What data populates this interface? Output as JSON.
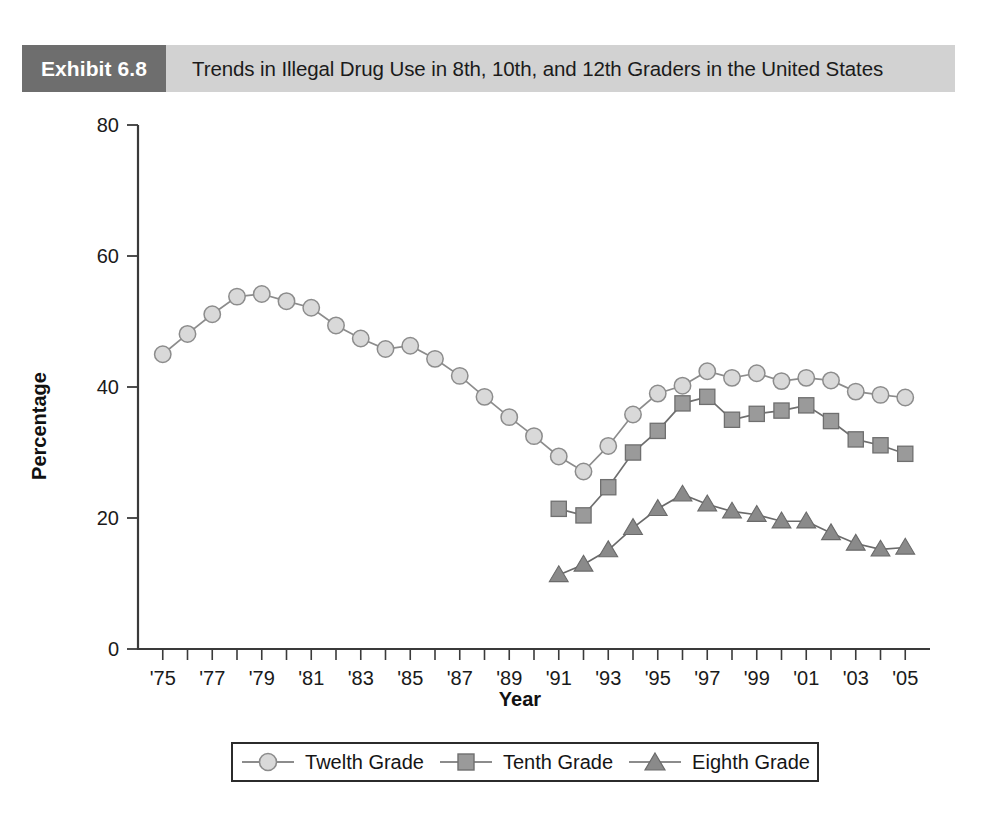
{
  "exhibit": {
    "tag": "Exhibit 6.8",
    "title": "Trends in Illegal Drug Use in 8th, 10th, and 12th Graders in the United States",
    "tag_bg": "#6e6e6e",
    "bar_bg": "#d2d2d2"
  },
  "chart_data": {
    "type": "line",
    "title": "Trends in Illegal Drug Use in 8th, 10th, and 12th Graders in the United States",
    "xlabel": "Year",
    "ylabel": "Percentage",
    "ylim": [
      0,
      80
    ],
    "yticks": [
      0,
      20,
      40,
      60,
      80
    ],
    "ytick_labels": [
      "0",
      "20",
      "40",
      "60",
      "80"
    ],
    "grid": false,
    "legend_position": "bottom",
    "x": [
      1975,
      1976,
      1977,
      1978,
      1979,
      1980,
      1981,
      1982,
      1983,
      1984,
      1985,
      1986,
      1987,
      1988,
      1989,
      1990,
      1991,
      1992,
      1993,
      1994,
      1995,
      1996,
      1997,
      1998,
      1999,
      2000,
      2001,
      2002,
      2003,
      2004,
      2005
    ],
    "xtick_labels": [
      "'75",
      "'77",
      "'79",
      "'81",
      "'83",
      "'85",
      "'87",
      "'89",
      "'91",
      "'93",
      "'95",
      "'97",
      "'99",
      "'01",
      "'03",
      "'05"
    ],
    "xtick_values": [
      1975,
      1977,
      1979,
      1981,
      1983,
      1985,
      1987,
      1989,
      1991,
      1993,
      1995,
      1997,
      1999,
      2001,
      2003,
      2005
    ],
    "xlim": [
      1974,
      2006
    ],
    "series": [
      {
        "name": "Twelth Grade",
        "marker": "circle",
        "color": "#d9d9d9",
        "stroke": "#8c8c8c",
        "x": [
          1975,
          1976,
          1977,
          1978,
          1979,
          1980,
          1981,
          1982,
          1983,
          1984,
          1985,
          1986,
          1987,
          1988,
          1989,
          1990,
          1991,
          1992,
          1993,
          1994,
          1995,
          1996,
          1997,
          1998,
          1999,
          2000,
          2001,
          2002,
          2003,
          2004,
          2005
        ],
        "values": [
          45.0,
          48.1,
          51.1,
          53.8,
          54.2,
          53.1,
          52.1,
          49.4,
          47.4,
          45.8,
          46.3,
          44.3,
          41.7,
          38.5,
          35.4,
          32.5,
          29.4,
          27.1,
          31.0,
          35.8,
          39.0,
          40.2,
          42.4,
          41.4,
          42.1,
          40.9,
          41.4,
          41.0,
          39.3,
          38.8,
          38.4
        ]
      },
      {
        "name": "Tenth Grade",
        "marker": "square",
        "color": "#9a9a9a",
        "stroke": "#6f6f6f",
        "x": [
          1991,
          1992,
          1993,
          1994,
          1995,
          1996,
          1997,
          1998,
          1999,
          2000,
          2001,
          2002,
          2003,
          2004,
          2005
        ],
        "values": [
          21.4,
          20.4,
          24.7,
          30.0,
          33.3,
          37.5,
          38.5,
          35.0,
          35.9,
          36.4,
          37.2,
          34.8,
          32.0,
          31.1,
          29.8
        ]
      },
      {
        "name": "Eighth Grade",
        "marker": "triangle",
        "color": "#8a8a8a",
        "stroke": "#6a6a6a",
        "x": [
          1991,
          1992,
          1993,
          1994,
          1995,
          1996,
          1997,
          1998,
          1999,
          2000,
          2001,
          2002,
          2003,
          2004,
          2005
        ],
        "values": [
          11.3,
          12.9,
          15.1,
          18.5,
          21.4,
          23.6,
          22.1,
          21.0,
          20.5,
          19.5,
          19.5,
          17.7,
          16.1,
          15.2,
          15.5
        ]
      }
    ]
  },
  "legend": {
    "entries": [
      {
        "label": "Twelth Grade",
        "marker": "circle",
        "icon": "circle-marker-icon"
      },
      {
        "label": "Tenth Grade",
        "marker": "square",
        "icon": "square-marker-icon"
      },
      {
        "label": "Eighth Grade",
        "marker": "triangle",
        "icon": "triangle-marker-icon"
      }
    ]
  }
}
